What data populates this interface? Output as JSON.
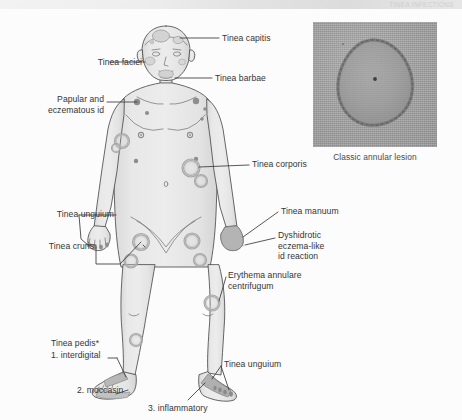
{
  "header": {
    "running_head": "TINEA INFECTIONS"
  },
  "figure": {
    "inset_caption": "Classic annular lesion",
    "footnote_marker": "*"
  },
  "colors": {
    "skin_fill": "#e4e4e4",
    "skin_outline": "#4a4a4a",
    "lesion_ring": "#bdbdbd",
    "lesion_dot": "#8f8f8f",
    "leader_line": "#3a3a3a",
    "label_text": "#353535",
    "photo_base": "#9e9e9e",
    "page_background": "#fcfcfc"
  },
  "labels": [
    {
      "id": "tinea-capitis",
      "text": "Tinea capitis",
      "align": "left",
      "x": 222,
      "y": 24,
      "width": 92
    },
    {
      "id": "tinea-faciei",
      "text": "Tinea faciei",
      "align": "right",
      "x": 76,
      "y": 48,
      "width": 66
    },
    {
      "id": "tinea-barbae",
      "text": "Tinea barbae",
      "align": "left",
      "x": 215,
      "y": 64,
      "width": 92
    },
    {
      "id": "papular-eczematous-id",
      "text": "Papular and\neczematous id",
      "align": "right",
      "x": 50,
      "y": 86,
      "width": 92
    },
    {
      "id": "tinea-corporis",
      "text": "Tinea corporis",
      "align": "left",
      "x": 252,
      "y": 151,
      "width": 92
    },
    {
      "id": "tinea-unguium-hand",
      "text": "Tinea unguium",
      "align": "right",
      "x": 26,
      "y": 201,
      "width": 88
    },
    {
      "id": "tinea-manuum",
      "text": "Tinea manuum",
      "align": "left",
      "x": 281,
      "y": 198,
      "width": 92
    },
    {
      "id": "tinea-cruris",
      "text": "Tinea cruris",
      "align": "right",
      "x": 72,
      "y": 233,
      "width": 70
    },
    {
      "id": "dyshidrotic-eczema",
      "text": "Dyshidrotic\neczema-like\nid reaction",
      "align": "left",
      "x": 278,
      "y": 222,
      "width": 86
    },
    {
      "id": "erythema-annulare",
      "text": "Erythema annulare\ncentrifugum",
      "align": "left",
      "x": 228,
      "y": 262,
      "width": 104
    },
    {
      "id": "tinea-pedis",
      "text": "Tinea pedis*",
      "align": "left",
      "x": 51,
      "y": 330,
      "width": 74
    },
    {
      "id": "pedis-interdigital",
      "text": "1. interdigital",
      "align": "left",
      "x": 51,
      "y": 342,
      "width": 74
    },
    {
      "id": "pedis-moccasin",
      "text": "2. moccasin",
      "align": "left",
      "x": 77,
      "y": 377,
      "width": 74
    },
    {
      "id": "pedis-inflammatory",
      "text": "3. inflammatory",
      "align": "left",
      "x": 148,
      "y": 395,
      "width": 90
    },
    {
      "id": "tinea-unguium-foot",
      "text": "Tinea unguium",
      "align": "left",
      "x": 224,
      "y": 351,
      "width": 92
    }
  ]
}
